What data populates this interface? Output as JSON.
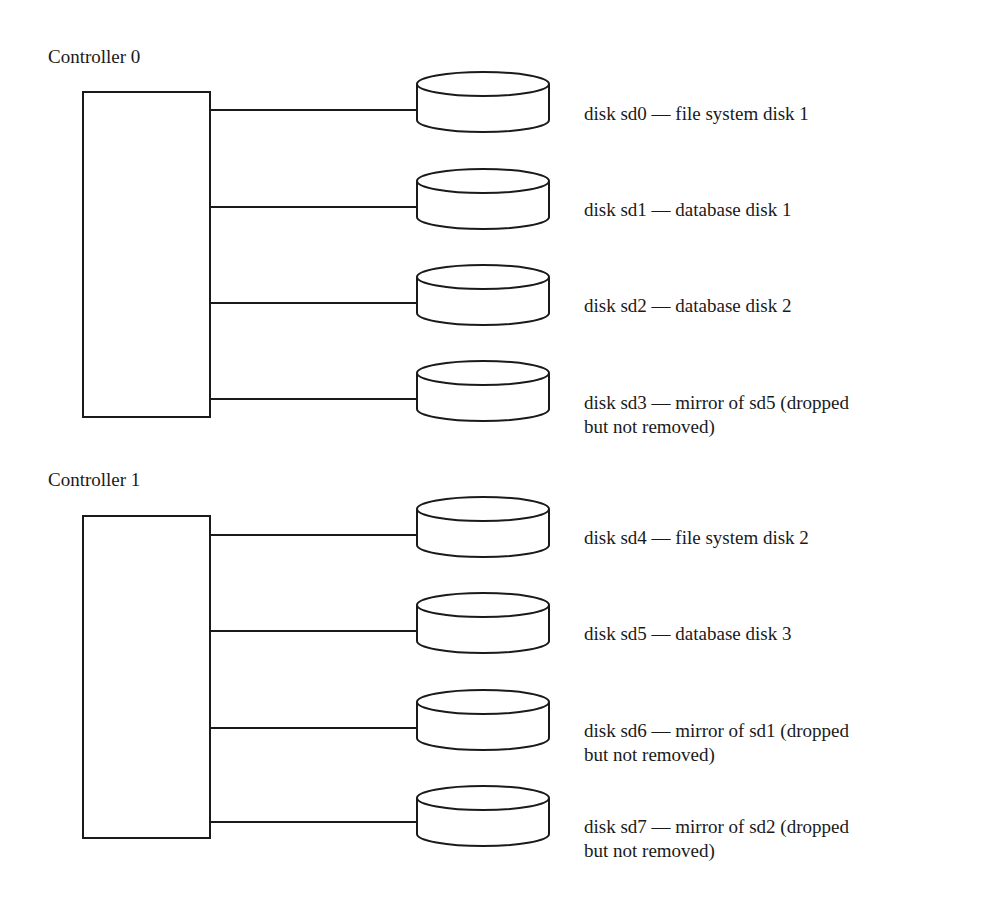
{
  "controllers": [
    {
      "label": "Controller 0",
      "disks": [
        {
          "id": "sd0",
          "label_line1": "disk sd0 — file system disk 1",
          "label_line2": ""
        },
        {
          "id": "sd1",
          "label_line1": "disk sd1 — database disk 1",
          "label_line2": ""
        },
        {
          "id": "sd2",
          "label_line1": "disk sd2 — database disk 2",
          "label_line2": ""
        },
        {
          "id": "sd3",
          "label_line1": "disk sd3 — mirror of sd5 (dropped",
          "label_line2": "but not removed)"
        }
      ]
    },
    {
      "label": "Controller 1",
      "disks": [
        {
          "id": "sd4",
          "label_line1": "disk sd4 — file system disk 2",
          "label_line2": ""
        },
        {
          "id": "sd5",
          "label_line1": "disk sd5 — database disk 3",
          "label_line2": ""
        },
        {
          "id": "sd6",
          "label_line1": "disk sd6 — mirror of sd1 (dropped",
          "label_line2": "but not removed)"
        },
        {
          "id": "sd7",
          "label_line1": "disk sd7 — mirror of sd2  (dropped",
          "label_line2": "but not removed)"
        }
      ]
    }
  ],
  "colors": {
    "stroke": "#1a1a1a",
    "background": "#ffffff"
  }
}
